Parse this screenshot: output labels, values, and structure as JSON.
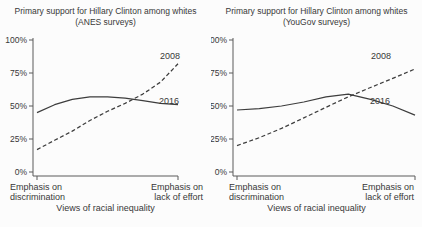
{
  "figure": {
    "colors": {
      "background": "#fcfcfc",
      "text": "#383838",
      "axis": "#5a5a5a",
      "line": "#3d3d3d"
    }
  },
  "chart_data": [
    {
      "type": "line",
      "title": "Primary support for Hillary Clinton among whites",
      "subtitle": "(ANES surveys)",
      "xlabel": "Views of racial inequality",
      "x_left_label_line1": "Emphasis on",
      "x_left_label_line2": "discrimination",
      "x_right_label_line1": "Emphasis on",
      "x_right_label_line2": "lack of effort",
      "ylim": [
        0,
        100
      ],
      "ytick_labels": [
        "0%",
        "25%",
        "50%",
        "75%",
        "100%"
      ],
      "ytick_values": [
        0,
        25,
        50,
        75,
        100
      ],
      "x_fractions": [
        0,
        0.125,
        0.25,
        0.375,
        0.5,
        0.625,
        0.75,
        0.875,
        1
      ],
      "legend_position": "inline-right",
      "grid": false,
      "series": [
        {
          "name": "2008",
          "style": "dashed",
          "values": [
            17,
            24,
            31,
            39,
            46,
            52,
            59,
            68,
            82
          ]
        },
        {
          "name": "2016",
          "style": "solid",
          "values": [
            45,
            51,
            55,
            57,
            57,
            56,
            54,
            52,
            51
          ]
        }
      ]
    },
    {
      "type": "line",
      "title": "Primary support for Hillary Clinton among whites",
      "subtitle": "(YouGov surveys)",
      "xlabel": "Views of racial inequality",
      "x_left_label_line1": "Emphasis on",
      "x_left_label_line2": "discrimination",
      "x_right_label_line1": "Emphasis on",
      "x_right_label_line2": "lack of effort",
      "ylim": [
        0,
        100
      ],
      "ytick_labels": [
        "0%",
        "25%",
        "50%",
        "75%",
        "100%"
      ],
      "ytick_values": [
        0,
        25,
        50,
        75,
        100
      ],
      "x_fractions": [
        0,
        0.125,
        0.25,
        0.375,
        0.5,
        0.625,
        0.75,
        0.875,
        1
      ],
      "legend_position": "inline-right",
      "grid": false,
      "series": [
        {
          "name": "2008",
          "style": "dashed",
          "values": [
            20,
            26,
            33,
            41,
            49,
            57,
            64,
            71,
            78
          ]
        },
        {
          "name": "2016",
          "style": "solid",
          "values": [
            47,
            48,
            50,
            53,
            57,
            59,
            55,
            50,
            43
          ]
        }
      ]
    }
  ]
}
